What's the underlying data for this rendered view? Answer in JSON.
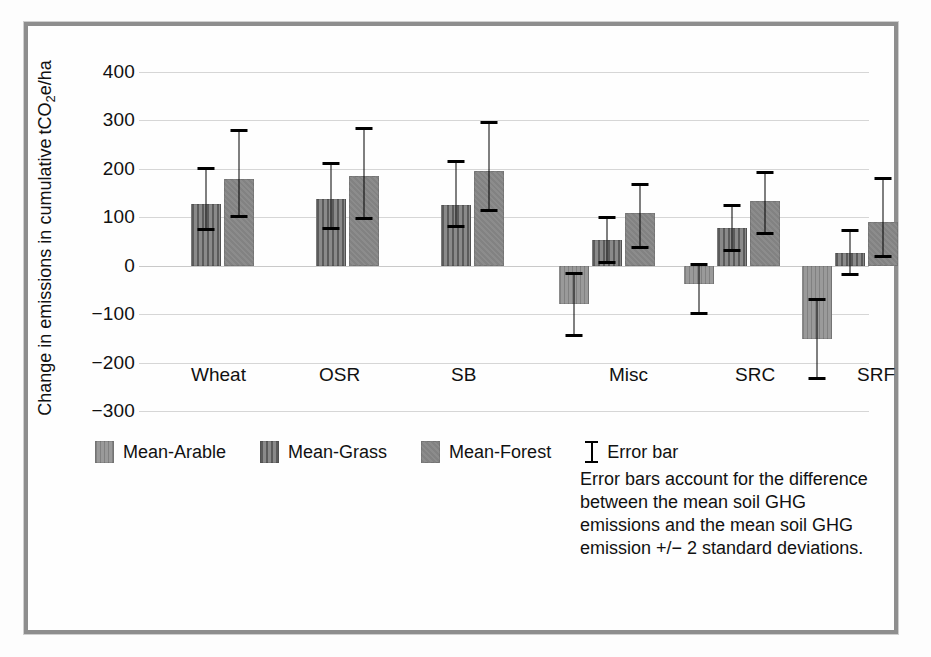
{
  "chart_data": {
    "type": "bar",
    "title": "",
    "xlabel": "",
    "ylabel": "Change in emissions in cumulative tCO2e/ha",
    "ylabel_line1": "Change in emissions in cumulative",
    "ylabel_line2_pre": "tCO",
    "ylabel_line2_sub": "2",
    "ylabel_line2_post": "e/ha",
    "ylim": [
      -300,
      400
    ],
    "ytick_labels": [
      "400",
      "300",
      "200",
      "100",
      "0",
      "−100",
      "−200",
      "−300"
    ],
    "ytick_values": [
      400,
      300,
      200,
      100,
      0,
      -100,
      -200,
      -300
    ],
    "grid": true,
    "legend_position": "bottom-left",
    "categories": [
      "Wheat",
      "OSR",
      "SB",
      "Misc",
      "SRC",
      "SRF"
    ],
    "series": [
      {
        "name": "Mean-Arable",
        "pattern": "light-vertical-hatch",
        "color": "#9a9a9a",
        "values": [
          null,
          null,
          null,
          -80,
          -38,
          -152
        ],
        "err_low": [
          null,
          null,
          null,
          -147,
          -102,
          -235
        ],
        "err_high": [
          null,
          null,
          null,
          -12,
          5,
          -67
        ]
      },
      {
        "name": "Mean-Grass",
        "pattern": "dark-vertical-hatch",
        "color": "#8a8a8a",
        "values": [
          128,
          138,
          125,
          53,
          78,
          27
        ],
        "err_low": [
          72,
          74,
          78,
          4,
          28,
          -22
        ],
        "err_high": [
          203,
          215,
          219,
          102,
          128,
          76
        ]
      },
      {
        "name": "Mean-Forest",
        "pattern": "solid-grey",
        "color": "#8c8c8c",
        "values": [
          180,
          185,
          196,
          108,
          133,
          90
        ],
        "err_low": [
          98,
          94,
          110,
          34,
          63,
          15
        ],
        "err_high": [
          282,
          286,
          298,
          171,
          195,
          183
        ]
      }
    ]
  },
  "legend": {
    "items": [
      {
        "label": "Mean-Arable",
        "swatch": "light-vertical-hatch"
      },
      {
        "label": "Mean-Grass",
        "swatch": "dark-vertical-hatch"
      },
      {
        "label": "Mean-Forest",
        "swatch": "solid-grey"
      }
    ],
    "error_bar_label": "Error bar",
    "note_lines": [
      "Error bars account for the difference",
      "between the mean soil GHG",
      "emissions and the mean soil GHG",
      "emission +/− 2 standard deviations."
    ]
  },
  "colors": {
    "frame": "#8e8e8e",
    "grid": "#d6d6d6",
    "text": "#111111",
    "error_bar": "#000000"
  }
}
